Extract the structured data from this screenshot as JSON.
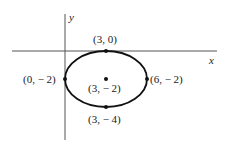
{
  "diagram": {
    "type": "ellipse-on-coordinate-plane",
    "axes": {
      "x_label": "x",
      "y_label": "y"
    },
    "ellipse": {
      "center": [
        3,
        -2
      ],
      "semi_axis_x": 3,
      "semi_axis_y": 2
    },
    "points": [
      {
        "id": "top",
        "coords": [
          3,
          0
        ],
        "label": "(3, 0)"
      },
      {
        "id": "left",
        "coords": [
          0,
          -2
        ],
        "label": "(0, − 2)"
      },
      {
        "id": "center",
        "coords": [
          3,
          -2
        ],
        "label": "(3, − 2)"
      },
      {
        "id": "right",
        "coords": [
          6,
          -2
        ],
        "label": "(6, − 2)"
      },
      {
        "id": "bottom",
        "coords": [
          3,
          -4
        ],
        "label": "(3, − 4)"
      }
    ],
    "colors": {
      "curve": "#111111",
      "axes": "#555555",
      "text": "#1a1a1a"
    }
  }
}
